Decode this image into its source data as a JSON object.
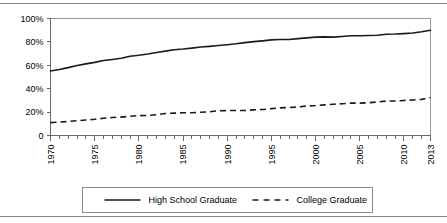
{
  "chart_data": {
    "type": "line",
    "title": "",
    "xlabel": "",
    "ylabel": "",
    "xlim": [
      1970,
      2013
    ],
    "ylim": [
      0,
      100
    ],
    "grid": false,
    "legend_position": "bottom",
    "x": [
      1970,
      1971,
      1972,
      1973,
      1974,
      1975,
      1976,
      1977,
      1978,
      1979,
      1980,
      1981,
      1982,
      1983,
      1984,
      1985,
      1986,
      1987,
      1988,
      1989,
      1990,
      1991,
      1992,
      1993,
      1994,
      1995,
      1996,
      1997,
      1998,
      1999,
      2000,
      2001,
      2002,
      2003,
      2004,
      2005,
      2006,
      2007,
      2008,
      2009,
      2010,
      2011,
      2012,
      2013
    ],
    "xtick_labels": [
      "1970",
      "1975",
      "1980",
      "1985",
      "1990",
      "1995",
      "2000",
      "2005",
      "2010",
      "2013"
    ],
    "xtick_values": [
      1970,
      1975,
      1980,
      1985,
      1990,
      1995,
      2000,
      2005,
      2010,
      2013
    ],
    "ytick_labels": [
      "0",
      "20%",
      "40%",
      "60%",
      "80%",
      "100%"
    ],
    "ytick_values": [
      0,
      20,
      40,
      60,
      80,
      100
    ],
    "series": [
      {
        "name": "High School Graduate",
        "style": "solid",
        "color": "#1a1a1a",
        "values": [
          55.2,
          56.4,
          58.0,
          59.8,
          61.2,
          62.5,
          64.1,
          65.0,
          66.0,
          67.7,
          68.6,
          69.7,
          71.0,
          72.1,
          73.3,
          73.9,
          74.7,
          75.6,
          76.2,
          76.9,
          77.6,
          78.4,
          79.4,
          80.2,
          80.9,
          81.7,
          82.0,
          82.1,
          82.8,
          83.4,
          84.1,
          84.3,
          84.1,
          84.6,
          85.2,
          85.2,
          85.5,
          85.7,
          86.6,
          86.7,
          87.1,
          87.6,
          88.7,
          90.0
        ]
      },
      {
        "name": "College Graduate",
        "style": "dashed",
        "color": "#1a1a1a",
        "values": [
          11.0,
          11.4,
          12.0,
          12.6,
          13.3,
          13.9,
          14.7,
          15.4,
          15.7,
          16.4,
          17.0,
          17.1,
          17.7,
          18.8,
          19.1,
          19.4,
          19.4,
          19.9,
          20.3,
          21.1,
          21.3,
          21.4,
          21.4,
          21.9,
          22.2,
          23.0,
          23.6,
          23.9,
          24.4,
          25.2,
          25.6,
          26.2,
          26.7,
          27.2,
          27.7,
          27.7,
          28.0,
          28.7,
          29.4,
          29.5,
          29.9,
          30.4,
          30.9,
          32.5
        ]
      }
    ]
  },
  "legend": {
    "items": [
      {
        "label": "High School Graduate",
        "style": "solid"
      },
      {
        "label": "College Graduate",
        "style": "dashed"
      }
    ]
  }
}
